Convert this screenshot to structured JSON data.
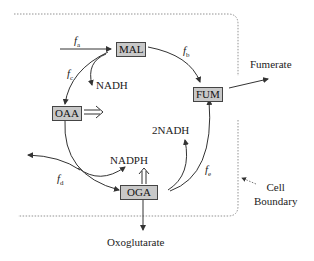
{
  "metabolites": {
    "mal": "MAL",
    "fum": "FUM",
    "oaa": "OAA",
    "oga": "OGA"
  },
  "fluxes": {
    "a": {
      "symbol": "f",
      "sub": "a"
    },
    "b": {
      "symbol": "f",
      "sub": "b"
    },
    "c": {
      "symbol": "f",
      "sub": "c"
    },
    "d": {
      "symbol": "f",
      "sub": "d"
    },
    "e": {
      "symbol": "f",
      "sub": "e"
    }
  },
  "cofactors": {
    "nadh": "NADH",
    "two_nadh": "2NADH",
    "nadph": "NADPH"
  },
  "outputs": {
    "fumerate": "Fumerate",
    "oxoglutarate": "Oxoglutarate"
  },
  "boundary": {
    "line1": "Cell",
    "line2": "Boundary"
  },
  "colors": {
    "box_fill": "#c8c8c8",
    "line": "#333333",
    "boundary": "#777777"
  }
}
